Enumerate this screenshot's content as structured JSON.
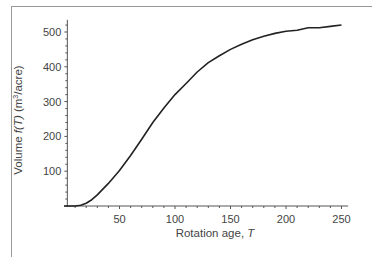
{
  "chart_data": {
    "type": "line",
    "title": "",
    "xlabel": "Rotation age, T",
    "ylabel": "Volume f(T) (m³/acre)",
    "xlim": [
      0,
      255
    ],
    "ylim": [
      0,
      530
    ],
    "x_ticks": [
      50,
      100,
      150,
      200,
      250
    ],
    "y_ticks": [
      100,
      200,
      300,
      400,
      500
    ],
    "grid": false,
    "legend": null,
    "series": [
      {
        "name": "f(T)",
        "color": "#222222",
        "x": [
          0,
          10,
          15,
          20,
          25,
          30,
          40,
          50,
          60,
          70,
          80,
          90,
          100,
          110,
          120,
          130,
          140,
          150,
          160,
          170,
          180,
          190,
          200,
          210,
          220,
          230,
          240,
          250
        ],
        "y": [
          0,
          0,
          2,
          8,
          18,
          32,
          65,
          102,
          145,
          192,
          240,
          282,
          320,
          352,
          385,
          412,
          432,
          450,
          465,
          478,
          488,
          496,
          502,
          505,
          512,
          512,
          516,
          520
        ]
      }
    ]
  },
  "labels": {
    "xlabel_text": "Rotation age, ",
    "xlabel_var": "T",
    "ylabel_prefix": "Volume ",
    "ylabel_func": "f(T)",
    "ylabel_unit_pre": " (m",
    "ylabel_unit_sup": "3",
    "ylabel_unit_post": "/acre)"
  }
}
